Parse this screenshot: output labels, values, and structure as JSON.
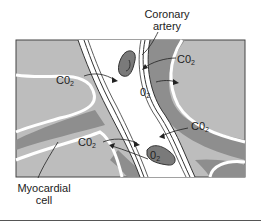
{
  "diagram": {
    "labels": {
      "coronary_artery": [
        "Coronary",
        "artery"
      ],
      "myocardial_cell": [
        "Myocardial",
        "cell"
      ]
    },
    "gas_labels": [
      {
        "id": "co2-upper-left",
        "base": "C0",
        "sub": "2"
      },
      {
        "id": "co2-upper-right",
        "base": "C0",
        "sub": "2"
      },
      {
        "id": "o2-upper",
        "base": "0",
        "sub": "2"
      },
      {
        "id": "co2-lower-left",
        "base": "C0",
        "sub": "2"
      },
      {
        "id": "co2-lower-right",
        "base": "C0",
        "sub": "2"
      },
      {
        "id": "o2-rbc",
        "base": "0",
        "sub": "2"
      }
    ],
    "colors": {
      "tissue": "#bdbdbd",
      "interstitial": "#8e8e8e",
      "rbc": "#7a7a7a",
      "lumen": "#ffffff",
      "outline": "#333333"
    }
  }
}
